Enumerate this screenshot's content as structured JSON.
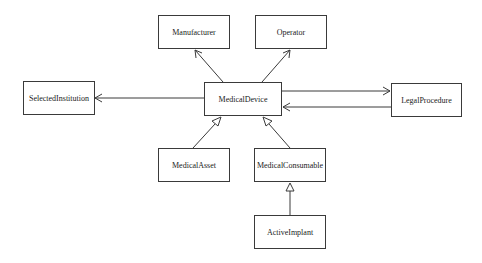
{
  "diagram": {
    "type": "uml-class-diagram",
    "classes": {
      "manufacturer": {
        "name": "Manufacturer"
      },
      "operator": {
        "name": "Operator"
      },
      "selected_institution": {
        "name": "SelectedInstitution"
      },
      "medical_device": {
        "name": "MedicalDevice"
      },
      "legal_procedure": {
        "name": "LegalProcedure"
      },
      "medical_asset": {
        "name": "MedicalAsset"
      },
      "medical_consumable": {
        "name": "MedicalConsumable"
      },
      "active_implant": {
        "name": "ActiveImplant"
      }
    },
    "relationships": [
      {
        "from": "MedicalDevice",
        "to": "Manufacturer",
        "kind": "association",
        "arrow": "open"
      },
      {
        "from": "MedicalDevice",
        "to": "Operator",
        "kind": "association",
        "arrow": "open"
      },
      {
        "from": "MedicalDevice",
        "to": "SelectedInstitution",
        "kind": "association",
        "arrow": "open"
      },
      {
        "from": "MedicalDevice",
        "to": "LegalProcedure",
        "kind": "association",
        "arrow": "open"
      },
      {
        "from": "LegalProcedure",
        "to": "MedicalDevice",
        "kind": "association",
        "arrow": "open"
      },
      {
        "from": "MedicalAsset",
        "to": "MedicalDevice",
        "kind": "generalization",
        "arrow": "hollow-triangle"
      },
      {
        "from": "MedicalConsumable",
        "to": "MedicalDevice",
        "kind": "generalization",
        "arrow": "hollow-triangle"
      },
      {
        "from": "ActiveImplant",
        "to": "MedicalConsumable",
        "kind": "generalization",
        "arrow": "hollow-triangle"
      }
    ]
  }
}
